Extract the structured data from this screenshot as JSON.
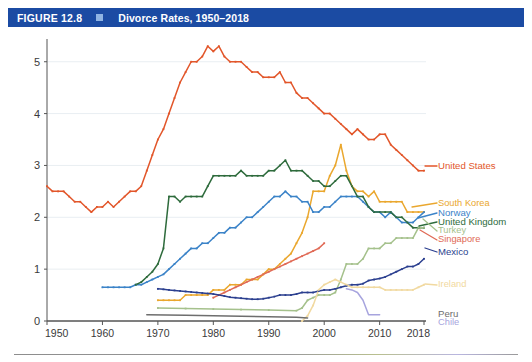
{
  "header": {
    "figure_number": "FIGURE 12.8",
    "title": "Divorce Rates, 1950–2018",
    "bar_color": "#1b4ba3",
    "square_color": "#8fb4e3"
  },
  "chart_data": {
    "type": "line",
    "title": "Divorce Rates, 1950–2018",
    "xlabel": "",
    "ylabel": "",
    "xlim": [
      1950,
      2018
    ],
    "ylim": [
      0,
      5.4
    ],
    "grid": true,
    "grid_axis": "y",
    "legend_position": "right-inline",
    "xticks": [
      1950,
      1960,
      1970,
      1980,
      1990,
      2000,
      2010,
      2018
    ],
    "xtick_labels": [
      "1950",
      "1960",
      "1970",
      "1980",
      "1990",
      "2000",
      "2010",
      "2018"
    ],
    "yticks": [
      0,
      1,
      2,
      3,
      4,
      5
    ],
    "ytick_labels": [
      "0",
      "1",
      "2",
      "3",
      "4",
      "5"
    ],
    "series": [
      {
        "name": "United States",
        "color": "#e2562a",
        "label_color": "#e2562a",
        "x": [
          1950,
          1951,
          1952,
          1953,
          1954,
          1955,
          1956,
          1957,
          1958,
          1959,
          1960,
          1961,
          1962,
          1963,
          1964,
          1965,
          1966,
          1967,
          1968,
          1969,
          1970,
          1971,
          1972,
          1973,
          1974,
          1975,
          1976,
          1977,
          1978,
          1979,
          1980,
          1981,
          1982,
          1983,
          1984,
          1985,
          1986,
          1987,
          1988,
          1989,
          1990,
          1991,
          1992,
          1993,
          1994,
          1995,
          1996,
          1997,
          1998,
          1999,
          2000,
          2001,
          2002,
          2003,
          2004,
          2005,
          2006,
          2007,
          2008,
          2009,
          2010,
          2011,
          2012,
          2013,
          2014,
          2015,
          2016,
          2017,
          2018
        ],
        "values": [
          2.6,
          2.5,
          2.5,
          2.5,
          2.4,
          2.3,
          2.3,
          2.2,
          2.1,
          2.2,
          2.2,
          2.3,
          2.2,
          2.3,
          2.4,
          2.5,
          2.5,
          2.6,
          2.9,
          3.2,
          3.5,
          3.7,
          4.0,
          4.3,
          4.6,
          4.8,
          5.0,
          5.0,
          5.1,
          5.3,
          5.2,
          5.3,
          5.1,
          5.0,
          5.0,
          5.0,
          4.9,
          4.8,
          4.8,
          4.7,
          4.7,
          4.7,
          4.8,
          4.6,
          4.6,
          4.4,
          4.3,
          4.3,
          4.2,
          4.1,
          4.0,
          4.0,
          3.9,
          3.8,
          3.7,
          3.6,
          3.7,
          3.6,
          3.5,
          3.5,
          3.6,
          3.6,
          3.4,
          3.3,
          3.2,
          3.1,
          3.0,
          2.9,
          2.9
        ]
      },
      {
        "name": "South Korea",
        "color": "#eaa72e",
        "label_color": "#eaa72e",
        "x": [
          1970,
          1971,
          1972,
          1973,
          1974,
          1975,
          1976,
          1977,
          1978,
          1979,
          1980,
          1981,
          1982,
          1983,
          1984,
          1985,
          1986,
          1987,
          1988,
          1989,
          1990,
          1991,
          1992,
          1993,
          1994,
          1995,
          1996,
          1997,
          1998,
          1999,
          2000,
          2001,
          2002,
          2003,
          2004,
          2005,
          2006,
          2007,
          2008,
          2009,
          2010,
          2011,
          2012,
          2013,
          2014,
          2015,
          2016,
          2017,
          2018
        ],
        "values": [
          0.4,
          0.4,
          0.4,
          0.4,
          0.4,
          0.5,
          0.5,
          0.5,
          0.5,
          0.5,
          0.6,
          0.6,
          0.6,
          0.7,
          0.7,
          0.7,
          0.8,
          0.8,
          0.8,
          0.9,
          1.0,
          1.0,
          1.1,
          1.2,
          1.3,
          1.5,
          1.7,
          2.0,
          2.5,
          2.5,
          2.5,
          2.8,
          3.0,
          3.4,
          2.9,
          2.6,
          2.5,
          2.5,
          2.4,
          2.5,
          2.3,
          2.3,
          2.3,
          2.3,
          2.3,
          2.1,
          2.1,
          2.1,
          2.1
        ]
      },
      {
        "name": "Norway",
        "color": "#3b83c8",
        "label_color": "#3b83c8",
        "x": [
          1960,
          1961,
          1962,
          1963,
          1964,
          1965,
          1966,
          1967,
          1968,
          1969,
          1970,
          1971,
          1972,
          1973,
          1974,
          1975,
          1976,
          1977,
          1978,
          1979,
          1980,
          1981,
          1982,
          1983,
          1984,
          1985,
          1986,
          1987,
          1988,
          1989,
          1990,
          1991,
          1992,
          1993,
          1994,
          1995,
          1996,
          1997,
          1998,
          1999,
          2000,
          2001,
          2002,
          2003,
          2004,
          2005,
          2006,
          2007,
          2008,
          2009,
          2010,
          2011,
          2012,
          2013,
          2014,
          2015,
          2016,
          2017,
          2018
        ],
        "values": [
          0.65,
          0.65,
          0.65,
          0.65,
          0.65,
          0.65,
          0.7,
          0.7,
          0.75,
          0.8,
          0.85,
          0.9,
          1.0,
          1.1,
          1.2,
          1.3,
          1.4,
          1.4,
          1.5,
          1.5,
          1.6,
          1.7,
          1.7,
          1.8,
          1.8,
          1.9,
          2.0,
          2.0,
          2.1,
          2.2,
          2.3,
          2.4,
          2.4,
          2.5,
          2.4,
          2.4,
          2.3,
          2.3,
          2.1,
          2.1,
          2.2,
          2.2,
          2.3,
          2.4,
          2.4,
          2.4,
          2.4,
          2.3,
          2.2,
          2.1,
          2.1,
          2.0,
          2.1,
          2.0,
          1.9,
          1.9,
          1.9,
          2.0,
          2.1
        ]
      },
      {
        "name": "United Kingdom",
        "color": "#2e6b3c",
        "label_color": "#2e6b3c",
        "x": [
          1966,
          1967,
          1968,
          1969,
          1970,
          1971,
          1972,
          1973,
          1974,
          1975,
          1976,
          1977,
          1978,
          1979,
          1980,
          1981,
          1982,
          1983,
          1984,
          1985,
          1986,
          1987,
          1988,
          1989,
          1990,
          1991,
          1992,
          1993,
          1994,
          1995,
          1996,
          1997,
          1998,
          1999,
          2000,
          2001,
          2002,
          2003,
          2004,
          2005,
          2006,
          2007,
          2008,
          2009,
          2010,
          2011,
          2012,
          2013,
          2014,
          2015,
          2016,
          2017,
          2018
        ],
        "values": [
          0.7,
          0.75,
          0.85,
          0.95,
          1.1,
          1.4,
          2.4,
          2.4,
          2.3,
          2.4,
          2.4,
          2.4,
          2.4,
          2.6,
          2.8,
          2.8,
          2.8,
          2.8,
          2.8,
          2.9,
          2.8,
          2.8,
          2.8,
          2.8,
          2.9,
          2.9,
          3.0,
          3.1,
          2.9,
          2.9,
          2.9,
          2.8,
          2.7,
          2.7,
          2.6,
          2.6,
          2.7,
          2.8,
          2.8,
          2.6,
          2.4,
          2.4,
          2.2,
          2.1,
          2.1,
          2.1,
          2.1,
          2.0,
          2.0,
          1.9,
          1.8,
          1.8,
          1.8
        ]
      },
      {
        "name": "Turkey",
        "color": "#a5c18c",
        "label_color": "#a5c18c",
        "x": [
          1970,
          1975,
          1980,
          1985,
          1990,
          1995,
          1996,
          1997,
          1998,
          1999,
          2000,
          2001,
          2002,
          2003,
          2004,
          2005,
          2006,
          2007,
          2008,
          2009,
          2010,
          2011,
          2012,
          2013,
          2014,
          2015,
          2016,
          2017,
          2018
        ],
        "values": [
          0.25,
          0.24,
          0.23,
          0.22,
          0.21,
          0.2,
          0.25,
          0.4,
          0.45,
          0.5,
          0.5,
          0.5,
          0.55,
          0.8,
          1.1,
          1.1,
          1.1,
          1.2,
          1.4,
          1.4,
          1.4,
          1.5,
          1.5,
          1.6,
          1.6,
          1.6,
          1.6,
          1.8,
          1.8
        ]
      },
      {
        "name": "Singapore",
        "color": "#e06a56",
        "label_color": "#e06a56",
        "x": [
          1980,
          1981,
          1982,
          1983,
          1984,
          1985,
          1986,
          1987,
          1988,
          1989,
          1990,
          1991,
          1992,
          1993,
          1994,
          1995,
          1996,
          1997,
          1998,
          1999,
          2000
        ],
        "values": [
          0.45,
          0.5,
          0.55,
          0.6,
          0.65,
          0.7,
          0.75,
          0.8,
          0.85,
          0.9,
          0.95,
          1.0,
          1.05,
          1.1,
          1.15,
          1.2,
          1.25,
          1.3,
          1.35,
          1.4,
          1.5
        ]
      },
      {
        "name": "Mexico",
        "color": "#2b3f8f",
        "label_color": "#2b3f8f",
        "x": [
          1970,
          1971,
          1972,
          1973,
          1974,
          1975,
          1976,
          1977,
          1978,
          1979,
          1980,
          1981,
          1982,
          1983,
          1984,
          1985,
          1986,
          1987,
          1988,
          1989,
          1990,
          1991,
          1992,
          1993,
          1994,
          1995,
          1996,
          1997,
          1998,
          1999,
          2000,
          2001,
          2002,
          2003,
          2004,
          2005,
          2006,
          2007,
          2008,
          2009,
          2010,
          2011,
          2012,
          2013,
          2014,
          2015,
          2016,
          2017,
          2018
        ],
        "values": [
          0.62,
          0.61,
          0.6,
          0.59,
          0.58,
          0.57,
          0.56,
          0.55,
          0.54,
          0.53,
          0.52,
          0.5,
          0.48,
          0.46,
          0.45,
          0.44,
          0.43,
          0.42,
          0.42,
          0.43,
          0.45,
          0.47,
          0.5,
          0.5,
          0.5,
          0.52,
          0.55,
          0.55,
          0.55,
          0.58,
          0.6,
          0.6,
          0.62,
          0.65,
          0.68,
          0.7,
          0.7,
          0.72,
          0.78,
          0.8,
          0.82,
          0.85,
          0.9,
          0.95,
          1.0,
          1.05,
          1.05,
          1.1,
          1.2
        ]
      },
      {
        "name": "Ireland",
        "color": "#f1d9a0",
        "label_color": "#f1d9a0",
        "x": [
          1996,
          1997,
          1998,
          1999,
          2000,
          2001,
          2002,
          2003,
          2004,
          2005,
          2006,
          2007,
          2008,
          2009,
          2010,
          2011,
          2012,
          2013,
          2014,
          2015,
          2016,
          2017,
          2018
        ],
        "values": [
          0.0,
          0.1,
          0.3,
          0.6,
          0.7,
          0.75,
          0.8,
          0.75,
          0.7,
          0.65,
          0.65,
          0.65,
          0.65,
          0.65,
          0.65,
          0.6,
          0.6,
          0.6,
          0.6,
          0.6,
          0.6,
          0.65,
          0.7
        ]
      },
      {
        "name": "Peru",
        "color": "#6e6e6e",
        "label_color": "#6e6e6e",
        "x": [
          1968,
          1975,
          1980,
          1985,
          1990,
          1995,
          1997
        ],
        "values": [
          0.12,
          0.11,
          0.1,
          0.09,
          0.08,
          0.07,
          0.06
        ]
      },
      {
        "name": "Chile",
        "color": "#a7a4de",
        "label_color": "#a7a4de",
        "x": [
          2004,
          2005,
          2006,
          2007,
          2008,
          2009,
          2010
        ],
        "values": [
          0.62,
          0.6,
          0.55,
          0.4,
          0.12,
          0.12,
          0.12
        ]
      }
    ],
    "legend_labels": [
      {
        "name": "United States",
        "color": "#e2562a"
      },
      {
        "name": "South Korea",
        "color": "#eaa72e"
      },
      {
        "name": "Norway",
        "color": "#3b83c8"
      },
      {
        "name": "United Kingdom",
        "color": "#2e6b3c"
      },
      {
        "name": "Turkey",
        "color": "#a5c18c"
      },
      {
        "name": "Singapore",
        "color": "#e06a56"
      },
      {
        "name": "Mexico",
        "color": "#2b3f8f"
      },
      {
        "name": "Ireland",
        "color": "#f1d9a0"
      },
      {
        "name": "Peru",
        "color": "#6e6e6e"
      },
      {
        "name": "Chile",
        "color": "#a7a4de"
      }
    ]
  }
}
